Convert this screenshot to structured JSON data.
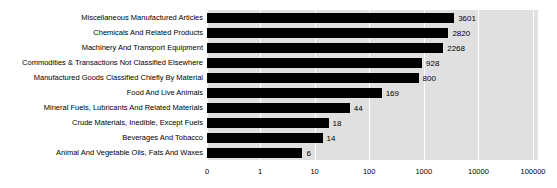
{
  "chart_data": {
    "type": "bar",
    "orientation": "horizontal",
    "title": "",
    "xlabel": "",
    "ylabel": "",
    "xscale": "log",
    "grid": true,
    "legend": false,
    "xticks": [
      "0",
      "1",
      "10",
      "100",
      "1000",
      "10000",
      "100000"
    ],
    "xtick_values": [
      0,
      1,
      10,
      100,
      1000,
      10000,
      100000
    ],
    "categories": [
      "Miscellaneous Manufactured Articles",
      "Chemicals And Related Products",
      "Machinery And Transport Equipment",
      "Commodities & Transactions Not Classified Elsewhere",
      "Manufactured Goods Classified Chiefly By Material",
      "Food And Live Animals",
      "Mineral Fuels, Lubricants And Related Materials",
      "Crude Materials, Inedible, Except Fuels",
      "Beverages And Tobacco",
      "Animal And Vegetable Oils, Fats And Waxes"
    ],
    "values": [
      3601,
      2820,
      2268,
      928,
      800,
      169,
      44,
      18,
      14,
      6
    ],
    "value_labels": [
      "3601",
      "2820",
      "2268",
      "928",
      "800",
      "169",
      "44",
      "18",
      "14",
      "6"
    ],
    "bar_color": "#000000",
    "plot_background": "#e0e0e0",
    "gridline_color": "#ffffff",
    "figure_background": "#ffffff"
  }
}
